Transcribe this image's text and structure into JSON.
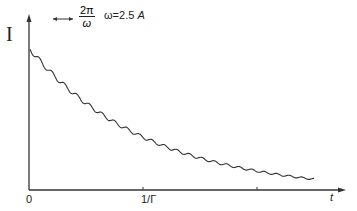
{
  "chart_data": {
    "type": "line",
    "title": "",
    "xlabel": "t",
    "ylabel": "I",
    "x_tick_labels": [
      "0",
      "1/Γ"
    ],
    "annotation": {
      "period_marker": {
        "numerator": "2π",
        "denominator": "ω"
      },
      "omega_text": "ω=2.5 A"
    },
    "decay_constant_units": "1/Γ at x-tick",
    "x": [
      0,
      0.25,
      0.5,
      0.75,
      1.0,
      1.25,
      1.5,
      1.75,
      2.0,
      2.25,
      2.5,
      2.75
    ],
    "values": [
      1.0,
      0.78,
      0.61,
      0.47,
      0.37,
      0.29,
      0.22,
      0.17,
      0.14,
      0.11,
      0.08,
      0.06
    ],
    "oscillation_amplitude_relative": 0.05,
    "xlim": [
      0,
      2.9
    ],
    "ylim": [
      0,
      1.2
    ],
    "grid": false,
    "color": "#333333"
  },
  "labels": {
    "y_axis": "I",
    "x_axis": "t",
    "origin": "0",
    "gamma_tick": "1/Γ",
    "period_num": "2π",
    "period_den": "ω",
    "omega_prefix": "ω=2.5 ",
    "omega_unit": "A"
  }
}
